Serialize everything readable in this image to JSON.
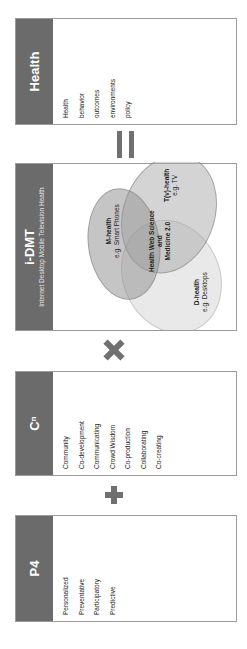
{
  "p4": {
    "title": "P4",
    "items": [
      "Personalized",
      "Preventative",
      "Participatory",
      "Predictive"
    ]
  },
  "cn": {
    "title": "Cⁿ",
    "items": [
      "Community",
      "Co-development",
      "Communicating",
      "Crowd Wisdom",
      "Co-production",
      "Collaborating",
      "Co-creating"
    ]
  },
  "idmt": {
    "title": "i-DMT",
    "subtitle": "Internet Desktop Mobile Television Health",
    "venn": {
      "m_title": "M-health",
      "m_sub": "e.g. Smart Phones",
      "t_title": "T(v)-health",
      "t_sub": "e.g. TV",
      "d_title": "D-health",
      "d_sub": "e.g. Desktops",
      "center_line1": "Health Web Science",
      "center_line2": "and",
      "center_line3": "Medicine 2.0"
    }
  },
  "health": {
    "title": "Health",
    "items": [
      "Health",
      "behavior",
      "outcomes",
      "environments",
      "policy"
    ]
  },
  "operators": {
    "plus": "+",
    "times": "×",
    "equals": "="
  },
  "colors": {
    "header": "#6b6b6b",
    "operator": "#707070",
    "border": "#9a9a9a"
  }
}
